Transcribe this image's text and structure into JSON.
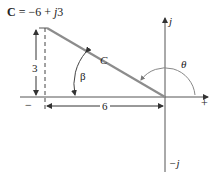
{
  "equation": {
    "bold": "C",
    "rest": " = −6 + ",
    "j": "j",
    "imag": "3"
  },
  "labels": {
    "vector": "C",
    "height": "3",
    "width": "6",
    "beta": "β",
    "theta": "θ",
    "j_axis": "j",
    "neg_j_axis": "−j",
    "plus": "+",
    "minus": "−"
  },
  "colors": {
    "vector": "#8c8c8c",
    "axis": "#555555",
    "text": "#222222"
  }
}
